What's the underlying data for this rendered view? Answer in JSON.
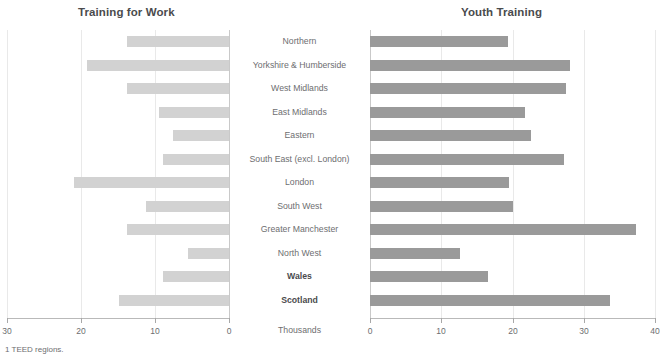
{
  "chart_data": {
    "type": "bar",
    "orientation": "horizontal",
    "layout": "back-to-back butterfly (two panels, shared categories)",
    "title_left": "Training for Work",
    "title_right": "Youth Training",
    "unit_label": "Thousands",
    "footnote": "1  TEED regions.",
    "categories": [
      "Northern",
      "Yorkshire & Humberside",
      "West Midlands",
      "East Midlands",
      "Eastern",
      "South East (excl. London)",
      "London",
      "South West",
      "Greater Manchester",
      "North West",
      "Wales",
      "Scotland"
    ],
    "bold_categories": [
      "Wales",
      "Scotland"
    ],
    "series": [
      {
        "name": "Training for Work",
        "panel": "left",
        "direction": "right-to-left",
        "color": "#d2d2d2",
        "xlim": [
          30,
          0
        ],
        "ticks": [
          30,
          20,
          10,
          0
        ],
        "values": [
          13.8,
          19.2,
          13.8,
          9.5,
          7.5,
          8.9,
          20.9,
          11.2,
          13.8,
          5.6,
          8.9,
          14.9
        ]
      },
      {
        "name": "Youth Training",
        "panel": "right",
        "direction": "left-to-right",
        "color": "#9a9a9a",
        "xlim": [
          0,
          40
        ],
        "ticks": [
          0,
          10,
          20,
          30,
          40
        ],
        "values": [
          19.3,
          28.0,
          27.5,
          21.7,
          22.6,
          27.2,
          19.5,
          20.1,
          37.3,
          12.7,
          16.5,
          33.7
        ]
      }
    ],
    "xlabel": "Thousands",
    "ylabel": "",
    "grid": "vertical gridlines, light grey",
    "legend": "none (panel titles act as series labels)"
  }
}
